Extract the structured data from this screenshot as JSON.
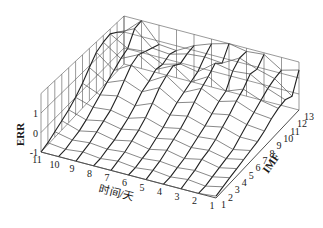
{
  "chart_data": {
    "type": "surface3d",
    "title": "",
    "xlabel": "时间/天",
    "ylabel": "IMF",
    "zlabel": "ERR",
    "x_ticks": [
      "11",
      "10",
      "9",
      "8",
      "7",
      "6",
      "5",
      "4",
      "3",
      "2",
      "1"
    ],
    "y_ticks": [
      "1",
      "2",
      "3",
      "4",
      "5",
      "6",
      "7",
      "8",
      "9",
      "10",
      "11",
      "12",
      "13"
    ],
    "z_ticks": [
      "-1",
      "0",
      "1"
    ],
    "xlim": [
      1,
      11
    ],
    "ylim": [
      1,
      13
    ],
    "zlim": [
      -1,
      2
    ],
    "grid": true,
    "line_color": "#222222",
    "grid_color": "#555555",
    "series": [
      {
        "name": "IMF 1",
        "values": [
          -1.0,
          -1.0,
          -1.0,
          -1.0,
          -1.0,
          -1.0,
          -1.0,
          -1.0,
          -1.0,
          -1.0,
          -0.9
        ]
      },
      {
        "name": "IMF 2",
        "values": [
          -0.9,
          -1.0,
          -0.9,
          -1.0,
          -0.9,
          -1.0,
          -0.9,
          -1.0,
          -0.9,
          -1.0,
          -0.8
        ]
      },
      {
        "name": "IMF 3",
        "values": [
          -0.7,
          -0.9,
          -0.8,
          -0.9,
          -0.8,
          -0.9,
          -0.8,
          -0.9,
          -0.8,
          -0.9,
          -0.7
        ]
      },
      {
        "name": "IMF 4",
        "values": [
          -0.5,
          -0.8,
          -0.6,
          -0.8,
          -0.6,
          -0.8,
          -0.6,
          -0.8,
          -0.6,
          -0.8,
          -0.6
        ]
      },
      {
        "name": "IMF 5",
        "values": [
          -0.3,
          -0.6,
          -0.4,
          -0.6,
          -0.4,
          -0.6,
          -0.4,
          -0.6,
          -0.5,
          -0.7,
          -0.5
        ]
      },
      {
        "name": "IMF 6",
        "values": [
          0.0,
          -0.3,
          -0.2,
          -0.4,
          -0.1,
          -0.4,
          -0.2,
          -0.4,
          -0.3,
          -0.6,
          -0.4
        ]
      },
      {
        "name": "IMF 7",
        "values": [
          0.4,
          0.0,
          0.2,
          -0.1,
          0.3,
          -0.1,
          0.1,
          -0.2,
          0.0,
          -0.3,
          -0.3
        ]
      },
      {
        "name": "IMF 8",
        "values": [
          0.9,
          0.3,
          0.7,
          0.3,
          0.8,
          0.2,
          0.5,
          0.1,
          0.3,
          0.0,
          -0.1
        ]
      },
      {
        "name": "IMF 9",
        "values": [
          1.4,
          0.6,
          1.2,
          0.5,
          1.1,
          0.4,
          0.9,
          0.4,
          0.7,
          0.3,
          0.2
        ]
      },
      {
        "name": "IMF 10",
        "values": [
          1.6,
          0.9,
          1.4,
          0.8,
          1.3,
          0.6,
          1.2,
          0.6,
          1.0,
          0.6,
          0.4
        ]
      },
      {
        "name": "IMF 11",
        "values": [
          1.7,
          1.1,
          1.2,
          0.7,
          1.0,
          0.8,
          1.6,
          1.4,
          1.5,
          0.9,
          0.5
        ]
      },
      {
        "name": "IMF 12",
        "values": [
          1.4,
          1.9,
          1.0,
          0.9,
          1.2,
          1.3,
          1.2,
          1.8,
          1.4,
          1.1,
          0.3
        ]
      },
      {
        "name": "IMF 13",
        "values": [
          1.0,
          2.0,
          0.8,
          0.7,
          1.3,
          1.7,
          2.0,
          1.8,
          1.9,
          1.2,
          1.5
        ]
      }
    ]
  }
}
